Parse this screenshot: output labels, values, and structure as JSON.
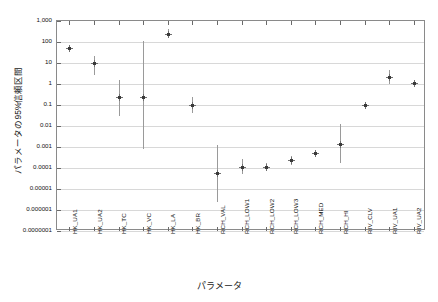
{
  "chart_data": {
    "type": "scatter",
    "title": "",
    "xlabel": "パラメータ",
    "ylabel": "パラメータの95%信頼区間",
    "yscale": "log",
    "ylim": [
      1e-07,
      1000
    ],
    "grid": true,
    "legend": "none",
    "ytick_labels": [
      "1,000",
      "100",
      "10",
      "1",
      "0.1",
      "0.01",
      "0.001",
      "0.0001",
      "0.00001",
      "0.000001",
      "0.0000001"
    ],
    "ytick_values": [
      1000,
      100,
      10,
      1,
      0.1,
      0.01,
      0.001,
      0.0001,
      1e-05,
      1e-06,
      1e-07
    ],
    "categories": [
      "HK_UA1",
      "HK_UA2",
      "HK_TC",
      "HK_VC",
      "HK_LA",
      "HK_BR",
      "RCH_VAL",
      "RCH_LOW1",
      "RCH_LOW2",
      "RCH_LOW3",
      "RCH_MED",
      "RCH_HI",
      "RIV_CLV",
      "RIV_UA1",
      "RIV_UA2"
    ],
    "series": [
      {
        "name": "95% confidence interval",
        "values": [
          50,
          10,
          0.25,
          0.25,
          250,
          0.1,
          6e-05,
          0.00011,
          0.00011,
          0.00023,
          0.0005,
          0.0014,
          0.105,
          2.2,
          1.15
        ],
        "lower": [
          40,
          2.8,
          0.03,
          0.0008,
          160,
          0.04,
          2.5e-06,
          5e-05,
          7e-05,
          0.00014,
          0.00035,
          0.00017,
          0.09,
          0.95,
          0.85
        ],
        "upper": [
          62,
          22,
          1.6,
          110,
          420,
          0.23,
          0.0013,
          0.00028,
          0.00018,
          0.00038,
          0.0007,
          0.012,
          0.125,
          4.5,
          1.6
        ]
      }
    ]
  }
}
